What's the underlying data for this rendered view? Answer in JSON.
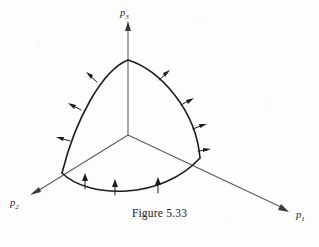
{
  "figure": {
    "caption": "Figure 5.33",
    "background_color": "#fdfdfd",
    "ink_color": "#1d1d1d",
    "axis_color": "#5a5a5a",
    "width": 319,
    "height": 247
  },
  "axes": [
    {
      "id": "p1",
      "label_main": "p",
      "label_sub": "1",
      "label_x": 296,
      "label_y": 218,
      "origin": [
        128,
        135
      ],
      "tip": [
        288,
        211
      ],
      "direction": "lower-right"
    },
    {
      "id": "p2",
      "label_main": "p",
      "label_sub": "2",
      "label_x": 10,
      "label_y": 206,
      "origin": [
        128,
        135
      ],
      "tip": [
        31,
        194
      ],
      "direction": "lower-left"
    },
    {
      "id": "p3",
      "label_main": "p",
      "label_sub": "3",
      "label_x": 120,
      "label_y": 16,
      "origin": [
        128,
        135
      ],
      "tip": [
        128,
        22
      ],
      "direction": "up"
    }
  ],
  "patch": {
    "name": "curved-triangular-surface",
    "vertices": {
      "top": [
        128,
        60
      ],
      "left": [
        62,
        173
      ],
      "right": [
        200,
        158
      ]
    },
    "arcs": [
      {
        "id": "arc-left",
        "from": "top",
        "to": "left",
        "bulge": "outward-left"
      },
      {
        "id": "arc-right",
        "from": "top",
        "to": "right",
        "bulge": "outward-right"
      },
      {
        "id": "arc-bottom",
        "from": "left",
        "to": "right",
        "bulge": "outward-down"
      }
    ]
  },
  "normal_arrows": {
    "arc_left": {
      "count": 3,
      "description": "arrows along the upper-left arc pointing outward-left",
      "items": [
        {
          "base": [
            96,
            81
          ],
          "tip": [
            88,
            74
          ]
        },
        {
          "base": [
            80,
            109
          ],
          "tip": [
            71,
            104
          ]
        },
        {
          "base": [
            69,
            140
          ],
          "tip": [
            59,
            137
          ]
        }
      ]
    },
    "arc_right": {
      "count": 4,
      "description": "arrows along the upper-right arc pointing outward-right",
      "items": [
        {
          "base": [
            160,
            79
          ],
          "tip": [
            168,
            72
          ]
        },
        {
          "base": [
            182,
            104
          ],
          "tip": [
            191,
            99
          ]
        },
        {
          "base": [
            194,
            128
          ],
          "tip": [
            204,
            124
          ]
        },
        {
          "base": [
            199,
            150
          ],
          "tip": [
            208,
            149
          ]
        }
      ]
    },
    "arc_bottom": {
      "count": 3,
      "description": "arrows along the bottom arc pointing straight up",
      "items": [
        {
          "base": [
            85,
            189
          ],
          "tip": [
            85,
            175
          ]
        },
        {
          "base": [
            115,
            195
          ],
          "tip": [
            115,
            181
          ]
        },
        {
          "base": [
            158,
            193
          ],
          "tip": [
            158,
            179
          ]
        }
      ]
    }
  }
}
